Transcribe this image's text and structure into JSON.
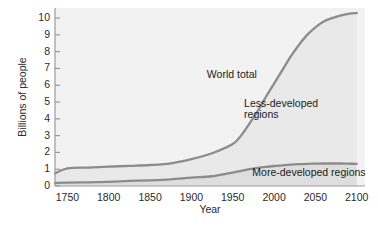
{
  "chart_data": {
    "type": "line",
    "title": "",
    "xlabel": "Year",
    "ylabel": "Billions of people",
    "xlim": [
      1735,
      2110
    ],
    "ylim": [
      0,
      10.6
    ],
    "grid": false,
    "legend_position": "inline-annotations",
    "x_ticks": [
      "1750",
      "1800",
      "1850",
      "1900",
      "1950",
      "2000",
      "2050",
      "2100"
    ],
    "x_tick_values": [
      1750,
      1800,
      1850,
      1900,
      1950,
      2000,
      2050,
      2100
    ],
    "y_ticks": [
      "0",
      "1",
      "2",
      "3",
      "4",
      "5",
      "6",
      "7",
      "8",
      "9",
      "10"
    ],
    "y_tick_values": [
      0,
      1,
      2,
      3,
      4,
      5,
      6,
      7,
      8,
      9,
      10
    ],
    "annotations": [
      {
        "text": "World total",
        "x": 1955,
        "y": 6.6
      },
      {
        "text": "Less-developed",
        "x": 2000,
        "y": 4.9
      },
      {
        "text": "regions",
        "x": 2000,
        "y": 4.2
      },
      {
        "text": "More-developed regions",
        "x": 2010,
        "y": 0.75
      }
    ],
    "x": [
      1735,
      1750,
      1775,
      1800,
      1825,
      1850,
      1875,
      1900,
      1925,
      1950,
      1960,
      1970,
      1980,
      1990,
      2000,
      2010,
      2020,
      2030,
      2040,
      2050,
      2060,
      2070,
      2080,
      2090,
      2100
    ],
    "series": [
      {
        "name": "World total",
        "color": "#8c8c8c",
        "values": [
          0.75,
          1.05,
          1.1,
          1.15,
          1.2,
          1.25,
          1.35,
          1.6,
          1.95,
          2.5,
          3.0,
          3.7,
          4.45,
          5.3,
          6.1,
          6.9,
          7.7,
          8.4,
          9.0,
          9.45,
          9.8,
          10.0,
          10.15,
          10.25,
          10.3
        ]
      },
      {
        "name": "More-developed regions",
        "color": "#8c8c8c",
        "values": [
          0.18,
          0.2,
          0.22,
          0.25,
          0.3,
          0.34,
          0.4,
          0.5,
          0.58,
          0.8,
          0.9,
          1.0,
          1.08,
          1.14,
          1.19,
          1.23,
          1.27,
          1.3,
          1.32,
          1.33,
          1.34,
          1.34,
          1.34,
          1.33,
          1.32
        ]
      }
    ],
    "shaded_bands": [
      {
        "name": "Less-developed regions",
        "between": [
          "More-developed regions",
          "World total"
        ],
        "fill": "#e8e8e8"
      },
      {
        "name": "More-developed regions band",
        "between": [
          "baseline",
          "More-developed regions"
        ],
        "fill": "#dcdcdc"
      }
    ],
    "colors": {
      "curve": "#8c8c8c",
      "axis": "#9a9a9a",
      "text": "#2b2b2b",
      "plot_background": "#f2f2f2",
      "band_less_developed": "#e9e9e9",
      "band_more_developed": "#dedede",
      "page_background": "#ffffff"
    }
  }
}
